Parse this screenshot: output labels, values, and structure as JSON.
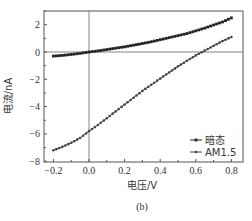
{
  "chart_data": {
    "type": "line",
    "title": "",
    "caption": "(b)",
    "xlabel": "电压/V",
    "ylabel": "电流/nA",
    "xlim": [
      -0.25,
      0.85
    ],
    "ylim": [
      -8,
      3
    ],
    "x_ticks": [
      -0.2,
      0.0,
      0.2,
      0.4,
      0.6,
      0.8
    ],
    "x_tick_labels": [
      "-0.2",
      "0.0",
      "0.2",
      "0.4",
      "0.6",
      "0.8"
    ],
    "y_ticks": [
      -8,
      -6,
      -4,
      -2,
      0,
      2
    ],
    "y_tick_labels": [
      "-8",
      "-6",
      "-4",
      "-2",
      "0",
      "2"
    ],
    "grid": false,
    "zero_lines": true,
    "legend_position": "lower right",
    "series": [
      {
        "name": "暗态",
        "marker": "square",
        "color": "#222222",
        "x": [
          -0.2,
          -0.15,
          -0.1,
          -0.05,
          0.0,
          0.05,
          0.1,
          0.15,
          0.2,
          0.25,
          0.3,
          0.35,
          0.4,
          0.45,
          0.5,
          0.55,
          0.6,
          0.65,
          0.7,
          0.75,
          0.8
        ],
        "y": [
          -0.3,
          -0.25,
          -0.18,
          -0.1,
          0.0,
          0.08,
          0.18,
          0.28,
          0.38,
          0.5,
          0.62,
          0.75,
          0.9,
          1.05,
          1.2,
          1.35,
          1.55,
          1.75,
          1.98,
          2.2,
          2.5
        ]
      },
      {
        "name": "AM1.5",
        "marker": "circle",
        "color": "#444444",
        "x": [
          -0.2,
          -0.15,
          -0.1,
          -0.05,
          0.0,
          0.05,
          0.1,
          0.15,
          0.2,
          0.25,
          0.3,
          0.35,
          0.4,
          0.45,
          0.5,
          0.55,
          0.6,
          0.65,
          0.7,
          0.75,
          0.8
        ],
        "y": [
          -7.2,
          -6.95,
          -6.65,
          -6.3,
          -5.8,
          -5.35,
          -4.85,
          -4.35,
          -3.85,
          -3.35,
          -2.85,
          -2.4,
          -1.95,
          -1.5,
          -1.05,
          -0.65,
          -0.25,
          0.1,
          0.45,
          0.8,
          1.1
        ]
      }
    ]
  },
  "legend": {
    "items": [
      {
        "label": "暗态"
      },
      {
        "label": "AM1.5"
      }
    ]
  },
  "labels": {
    "xlabel": "电压/V",
    "ylabel": "电流/nA",
    "caption": "(b)"
  }
}
